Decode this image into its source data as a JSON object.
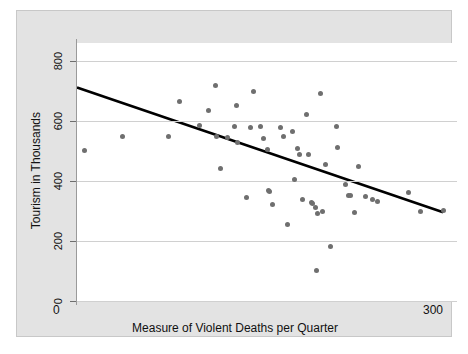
{
  "chart_data": {
    "type": "scatter",
    "title": "",
    "xlabel": "Measure of Violent Deaths per Quarter",
    "ylabel": "Tourism in Thousands",
    "xlim": [
      0,
      300
    ],
    "ylim": [
      0,
      860
    ],
    "x_ticks": [
      0,
      300
    ],
    "x_tick_labels": [
      "0",
      "300"
    ],
    "y_ticks": [
      0,
      200,
      400,
      600,
      800
    ],
    "y_tick_labels": [
      "0",
      "200",
      "400",
      "600",
      "800"
    ],
    "grid": "horizontal",
    "legend": "none",
    "point_color": "#6f6f6f",
    "line_color": "#000000",
    "plot_background": "#ffffff",
    "panel_background": "#e3e3e3",
    "gridline_color": "#d0d0d0",
    "trendline": {
      "label": "linear fit",
      "x_start": 0,
      "y_start": 712,
      "x_end": 289,
      "y_end": 296
    },
    "points": [
      {
        "x": 6,
        "y": 503
      },
      {
        "x": 36,
        "y": 547
      },
      {
        "x": 72,
        "y": 547
      },
      {
        "x": 81,
        "y": 666
      },
      {
        "x": 97,
        "y": 585
      },
      {
        "x": 104,
        "y": 634
      },
      {
        "x": 109,
        "y": 719
      },
      {
        "x": 110,
        "y": 547
      },
      {
        "x": 113,
        "y": 441
      },
      {
        "x": 119,
        "y": 545
      },
      {
        "x": 124,
        "y": 582
      },
      {
        "x": 126,
        "y": 651
      },
      {
        "x": 127,
        "y": 527
      },
      {
        "x": 134,
        "y": 345
      },
      {
        "x": 137,
        "y": 578
      },
      {
        "x": 139,
        "y": 697
      },
      {
        "x": 145,
        "y": 582
      },
      {
        "x": 147,
        "y": 542
      },
      {
        "x": 150,
        "y": 505
      },
      {
        "x": 151,
        "y": 369
      },
      {
        "x": 152,
        "y": 364
      },
      {
        "x": 154,
        "y": 322
      },
      {
        "x": 161,
        "y": 578
      },
      {
        "x": 163,
        "y": 548
      },
      {
        "x": 166,
        "y": 256
      },
      {
        "x": 170,
        "y": 565
      },
      {
        "x": 172,
        "y": 405
      },
      {
        "x": 174,
        "y": 510
      },
      {
        "x": 176,
        "y": 489
      },
      {
        "x": 178,
        "y": 340
      },
      {
        "x": 181,
        "y": 621
      },
      {
        "x": 183,
        "y": 489
      },
      {
        "x": 185,
        "y": 330
      },
      {
        "x": 186,
        "y": 325
      },
      {
        "x": 188,
        "y": 311
      },
      {
        "x": 189,
        "y": 103
      },
      {
        "x": 190,
        "y": 291
      },
      {
        "x": 192,
        "y": 691
      },
      {
        "x": 194,
        "y": 297
      },
      {
        "x": 196,
        "y": 456
      },
      {
        "x": 200,
        "y": 182
      },
      {
        "x": 205,
        "y": 582
      },
      {
        "x": 206,
        "y": 513
      },
      {
        "x": 212,
        "y": 388
      },
      {
        "x": 214,
        "y": 353
      },
      {
        "x": 216,
        "y": 352
      },
      {
        "x": 219,
        "y": 294
      },
      {
        "x": 222,
        "y": 450
      },
      {
        "x": 228,
        "y": 348
      },
      {
        "x": 233,
        "y": 338
      },
      {
        "x": 237,
        "y": 332
      },
      {
        "x": 262,
        "y": 363
      },
      {
        "x": 271,
        "y": 299
      },
      {
        "x": 289,
        "y": 302
      }
    ]
  }
}
